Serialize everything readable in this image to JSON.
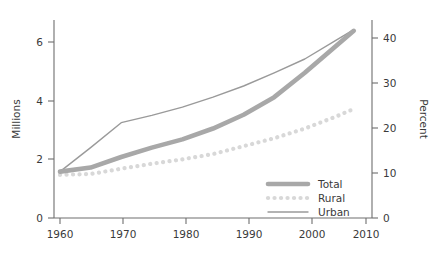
{
  "chart_data": {
    "type": "line",
    "title": "",
    "subtitle": "",
    "xlabel": "",
    "ylabel": "Millions",
    "y2label": "Percent",
    "xlim": [
      1960,
      2010
    ],
    "ylim": [
      0,
      6.8
    ],
    "y2lim": [
      0,
      44.3
    ],
    "grid": false,
    "legend_position": "bottom-right",
    "x_ticks": [
      1960,
      1970,
      1980,
      1990,
      2000,
      2010
    ],
    "x_tick_labels": [
      "1960",
      "1970",
      "1980",
      "1990",
      "2000",
      "2010"
    ],
    "y_ticks": [
      0,
      2,
      4,
      6
    ],
    "y_tick_labels": [
      "0",
      "2",
      "4",
      "6"
    ],
    "y2_ticks": [
      0,
      10,
      20,
      30,
      40
    ],
    "y2_tick_labels": [
      "0",
      "10",
      "20",
      "30",
      "40"
    ],
    "x": [
      1960,
      1965,
      1970,
      1975,
      1980,
      1985,
      1990,
      1995,
      2000,
      2005,
      2008
    ],
    "series": [
      {
        "name": "Total",
        "style": "thick-solid",
        "color": "#a8a8a8",
        "width": 4.6,
        "values": [
          1.58,
          1.72,
          2.08,
          2.4,
          2.68,
          3.05,
          3.52,
          4.12,
          4.95,
          5.85,
          6.38
        ]
      },
      {
        "name": "Rural",
        "style": "dotted",
        "color": "#d8d8d8",
        "width": 4.2,
        "values": [
          1.47,
          1.5,
          1.68,
          1.85,
          2.0,
          2.18,
          2.45,
          2.72,
          3.05,
          3.45,
          3.72
        ]
      },
      {
        "name": "Urban",
        "style": "thin-solid",
        "color": "#9a9a9a",
        "width": 1.4,
        "values": [
          1.58,
          2.4,
          3.25,
          3.5,
          3.78,
          4.12,
          4.5,
          4.95,
          5.42,
          6.05,
          6.42
        ]
      }
    ],
    "legend": [
      {
        "label": "Total",
        "swatch": "thick-solid",
        "color": "#a8a8a8"
      },
      {
        "label": "Rural",
        "swatch": "dotted",
        "color": "#d8d8d8"
      },
      {
        "label": "Urban",
        "swatch": "thin-solid",
        "color": "#9a9a9a"
      }
    ]
  },
  "colors": {
    "axis": "#6e6e6e",
    "text": "#3a3a3a",
    "total": "#a8a8a8",
    "rural": "#d8d8d8",
    "urban": "#9a9a9a",
    "background": "#ffffff"
  }
}
